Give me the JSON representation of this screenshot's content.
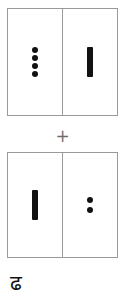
{
  "figure": {
    "operator_label": "+",
    "caption_glyph": "ढ",
    "colors": {
      "background": "#ffffff",
      "tile_border": "#9a9a9a",
      "pip": "#121212",
      "bar": "#121212",
      "operator": "#6e6e6e",
      "caption": "#121212"
    }
  },
  "dominoes": [
    {
      "id": "domino-top",
      "name": "top-domino",
      "halves": [
        {
          "side": "left",
          "mark_type": "pips",
          "count": 4,
          "value": 4
        },
        {
          "side": "right",
          "mark_type": "bar",
          "count": 1,
          "value": 1
        }
      ]
    },
    {
      "id": "domino-bottom",
      "name": "bottom-domino",
      "halves": [
        {
          "side": "left",
          "mark_type": "bar",
          "count": 1,
          "value": 1
        },
        {
          "side": "right",
          "mark_type": "pips",
          "count": 2,
          "value": 2
        }
      ]
    }
  ]
}
